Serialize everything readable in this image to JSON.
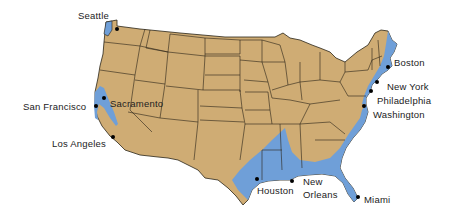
{
  "map": {
    "colors": {
      "land": "#cfac74",
      "coastal_zone": "#6f9fd8",
      "border": "#2a2418",
      "city_dot": "#000000",
      "label": "#222222",
      "background": "#ffffff"
    },
    "cities": [
      {
        "name": "Seattle",
        "label_x": 80,
        "label_y": 12,
        "dot_x": 117,
        "dot_y": 29
      },
      {
        "name": "San Francisco",
        "label_x": 24,
        "label_y": 103,
        "dot_x": 96,
        "dot_y": 106
      },
      {
        "name": "Sacramento",
        "label_x": 110,
        "label_y": 100,
        "dot_x": 104,
        "dot_y": 98
      },
      {
        "name": "Los Angeles",
        "label_x": 52,
        "label_y": 140,
        "dot_x": 113,
        "dot_y": 137
      },
      {
        "name": "Boston",
        "label_x": 393,
        "label_y": 58,
        "dot_x": 388,
        "dot_y": 67
      },
      {
        "name": "New York",
        "label_x": 386,
        "label_y": 82,
        "dot_x": 377,
        "dot_y": 82
      },
      {
        "name": "Philadelphia",
        "label_x": 378,
        "label_y": 96,
        "dot_x": 371,
        "dot_y": 91
      },
      {
        "name": "Washington",
        "label_x": 373,
        "label_y": 110,
        "dot_x": 364,
        "dot_y": 106
      },
      {
        "name": "Houston",
        "label_x": 258,
        "label_y": 187,
        "dot_x": 257,
        "dot_y": 179
      },
      {
        "name": "New",
        "label_x": 303,
        "label_y": 178,
        "dot_x": 292,
        "dot_y": 181
      },
      {
        "name": "Orleans",
        "label_x": 303,
        "label_y": 191,
        "dot_x": null,
        "dot_y": null
      },
      {
        "name": "Miami",
        "label_x": 363,
        "label_y": 197,
        "dot_x": 358,
        "dot_y": 197
      }
    ]
  }
}
